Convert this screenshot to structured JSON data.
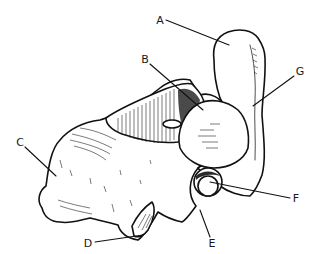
{
  "figure": {
    "labels": [
      {
        "id": "A",
        "text": "A",
        "x": 160,
        "y": 20,
        "target": [
          229,
          45
        ]
      },
      {
        "id": "B",
        "text": "B",
        "x": 145,
        "y": 59,
        "target": [
          203,
          110
        ]
      },
      {
        "id": "C",
        "text": "C",
        "x": 20,
        "y": 142,
        "target": [
          56,
          176
        ]
      },
      {
        "id": "D",
        "text": "D",
        "x": 88,
        "y": 243,
        "target": [
          143,
          235
        ]
      },
      {
        "id": "E",
        "text": "E",
        "x": 212,
        "y": 243,
        "target": [
          200,
          210
        ]
      },
      {
        "id": "F",
        "text": "F",
        "x": 296,
        "y": 198,
        "target": [
          210,
          182
        ]
      },
      {
        "id": "G",
        "text": "G",
        "x": 300,
        "y": 71,
        "target": [
          253,
          106
        ]
      }
    ]
  }
}
